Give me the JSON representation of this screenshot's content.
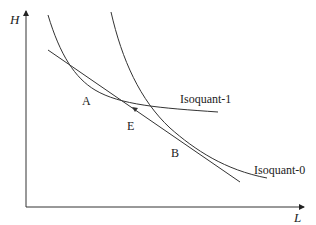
{
  "diagram": {
    "axes": {
      "y_label": "H",
      "x_label": "L"
    },
    "curves": [
      {
        "id": "isoquant-1",
        "label": "Isoquant-1"
      },
      {
        "id": "isoquant-0",
        "label": "Isoquant-0"
      },
      {
        "id": "tangent-line",
        "label": ""
      }
    ],
    "points": [
      {
        "id": "A",
        "label": "A"
      },
      {
        "id": "E",
        "label": "E"
      },
      {
        "id": "B",
        "label": "B"
      }
    ],
    "colors": {
      "stroke": "#333333",
      "background": "#ffffff"
    }
  }
}
